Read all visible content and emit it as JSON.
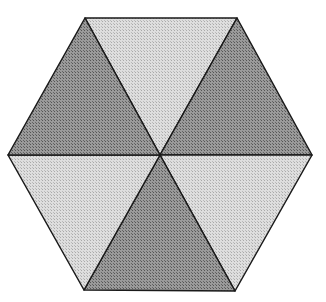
{
  "diagram": {
    "shape": "regular-hexagon",
    "center": [
      160,
      155
    ],
    "vertices": {
      "top_left": [
        85,
        18
      ],
      "top_right": [
        237,
        18
      ],
      "right": [
        312,
        155
      ],
      "bottom_right": [
        235,
        291
      ],
      "bottom_left": [
        84,
        290
      ],
      "left": [
        8,
        155
      ]
    },
    "triangles": [
      {
        "name": "top",
        "from": "top_left",
        "to": "top_right",
        "shade": "light"
      },
      {
        "name": "upper-right",
        "from": "top_right",
        "to": "right",
        "shade": "dark"
      },
      {
        "name": "lower-right",
        "from": "right",
        "to": "bottom_right",
        "shade": "light"
      },
      {
        "name": "bottom",
        "from": "bottom_right",
        "to": "bottom_left",
        "shade": "dark"
      },
      {
        "name": "lower-left",
        "from": "bottom_left",
        "to": "left",
        "shade": "light"
      },
      {
        "name": "upper-left",
        "from": "left",
        "to": "top_left",
        "shade": "dark"
      }
    ],
    "colors": {
      "dark": "#8a8a8a",
      "light": "#d4d4d4",
      "stroke": "#1a1a1a",
      "background": "#ffffff"
    }
  }
}
